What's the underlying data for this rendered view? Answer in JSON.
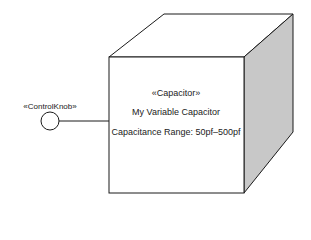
{
  "diagram": {
    "node": {
      "stereotype": "«Capacitor»",
      "name": "My Variable Capacitor",
      "attribute": "Capacitance Range: 50pf–500pf"
    },
    "interface": {
      "label": "«ControlKnob»"
    },
    "colors": {
      "stroke": "#1a1a1a",
      "front_face": "#ffffff",
      "top_face": "#ffffff",
      "side_face": "#c8c8c8"
    }
  }
}
